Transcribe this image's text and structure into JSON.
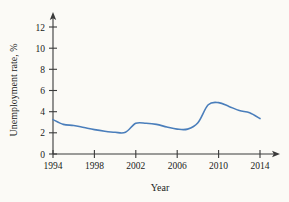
{
  "chart_data": {
    "type": "line",
    "title": "",
    "xlabel": "Year",
    "ylabel": "Unemployment rate, %",
    "xlim": [
      1994,
      2015
    ],
    "ylim": [
      0,
      13
    ],
    "xticks": [
      1994,
      1998,
      2002,
      2006,
      2010,
      2014
    ],
    "yticks": [
      0,
      2,
      4,
      6,
      8,
      10,
      12
    ],
    "xtick_labels": [
      "1994",
      "1998",
      "2002",
      "2006",
      "2010",
      "2014"
    ],
    "ytick_labels": [
      "0",
      "2",
      "4",
      "6",
      "8",
      "10",
      "12"
    ],
    "grid": false,
    "legend": false,
    "legend_position": "none",
    "line_color": "#4a7ebb",
    "axis_color": "#3a3a3a",
    "background_color": "#fbfaf6",
    "series": [
      {
        "name": "Unemployment rate",
        "x": [
          1994,
          1995,
          1996,
          1997,
          1998,
          1999,
          2000,
          2001,
          2002,
          2003,
          2004,
          2005,
          2006,
          2007,
          2008,
          2009,
          2010,
          2011,
          2012,
          2013,
          2014
        ],
        "values": [
          6.5,
          5.6,
          5.4,
          5.0,
          4.6,
          4.3,
          4.1,
          4.1,
          5.8,
          5.8,
          5.6,
          5.1,
          4.7,
          4.7,
          5.9,
          9.3,
          9.7,
          9.0,
          8.2,
          7.8,
          6.7
        ]
      }
    ]
  },
  "axes": {
    "y_title": "Unemployment rate, %",
    "x_title": "Year"
  }
}
